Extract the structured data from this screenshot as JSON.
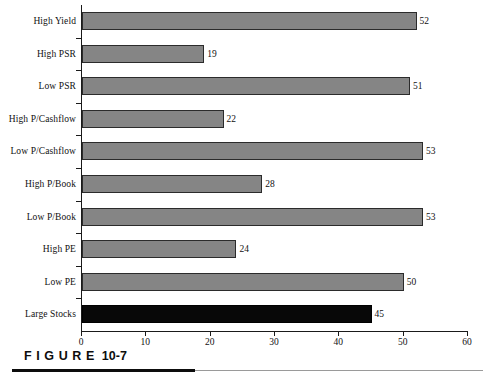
{
  "figure": {
    "caption_word": "FIGURE",
    "caption_number": "10-7"
  },
  "chart_data": {
    "type": "bar",
    "orientation": "horizontal",
    "title": "",
    "xlabel": "",
    "ylabel": "",
    "xlim": [
      0,
      60
    ],
    "xticks": [
      0,
      10,
      20,
      30,
      40,
      50,
      60
    ],
    "xtick_labels": [
      "0",
      "10",
      "20",
      "30",
      "40",
      "50",
      "60"
    ],
    "grid": false,
    "legend": false,
    "categories": [
      "High Yield",
      "High PSR",
      "Low PSR",
      "High P/Cashflow",
      "Low P/Cashflow",
      "High P/Book",
      "Low P/Book",
      "High PE",
      "Low PE",
      "Large Stocks"
    ],
    "values": [
      52,
      19,
      51,
      22,
      53,
      28,
      53,
      24,
      50,
      45
    ],
    "value_labels": [
      "52",
      "19",
      "51",
      "22",
      "53",
      "28",
      "53",
      "24",
      "50",
      "45"
    ],
    "bar_colors": [
      "#858585",
      "#858585",
      "#858585",
      "#858585",
      "#858585",
      "#858585",
      "#858585",
      "#858585",
      "#858585",
      "#080808"
    ],
    "highlight_index": 9,
    "colors": {
      "bar_gray": "#858585",
      "bar_black": "#080808",
      "bar_border": "#2b2b2b",
      "axis": "#1a1a1a",
      "text": "#111111",
      "rule_thick": "#0d0d0d",
      "rule_thin": "#9a9a9a",
      "background": "#ffffff"
    }
  }
}
